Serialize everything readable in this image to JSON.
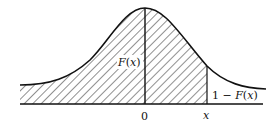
{
  "figure": {
    "type": "normal-distribution-cdf-diagram",
    "labels": {
      "cdf": "F(x)",
      "tail": "1 − F(x)",
      "origin": "0",
      "x_point": "x"
    },
    "colors": {
      "ink": "#111111",
      "background": "#ffffff"
    },
    "hatching": "diagonal lines under curve from left tail to x"
  }
}
